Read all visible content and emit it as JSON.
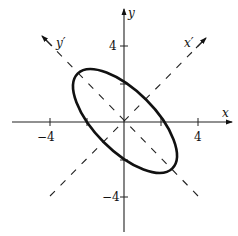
{
  "figure": {
    "axes": {
      "x_label": "x",
      "y_label": "y",
      "x_rot_label": "x′",
      "y_rot_label": "y′"
    },
    "ticks": {
      "x_neg": "−4",
      "x_pos": "4",
      "y_pos": "4",
      "y_neg": "−4"
    },
    "ellipse": {
      "center": [
        0,
        0
      ],
      "rotation_deg": 45,
      "semi_major_along": "y'",
      "semi_major_units": 3.6,
      "semi_minor_units": 1.6
    },
    "colors": {
      "stroke": "#111111",
      "background": "#ffffff"
    }
  }
}
